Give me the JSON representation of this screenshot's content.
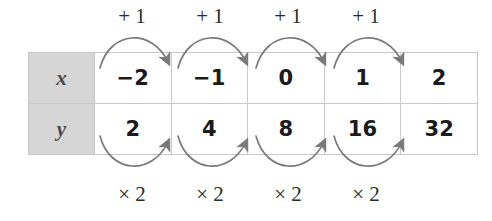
{
  "figure": {
    "type": "function-table-with-pattern-arrows",
    "table": {
      "rows": [
        {
          "header": "x",
          "values": [
            "−2",
            "−1",
            "0",
            "1",
            "2"
          ]
        },
        {
          "header": "y",
          "values": [
            "2",
            "4",
            "8",
            "16",
            "32"
          ]
        }
      ]
    },
    "top_operations": [
      "+ 1",
      "+ 1",
      "+ 1",
      "+ 1"
    ],
    "bottom_operations": [
      "× 2",
      "× 2",
      "× 2",
      "× 2"
    ],
    "colors": {
      "header_fill": "#d6d6d6",
      "grid_line": "#c9c9c9",
      "arrow": "#7a7a7a",
      "text": "#1b1b1b",
      "header_text": "#4a4a4a",
      "background": "#ffffff"
    }
  }
}
